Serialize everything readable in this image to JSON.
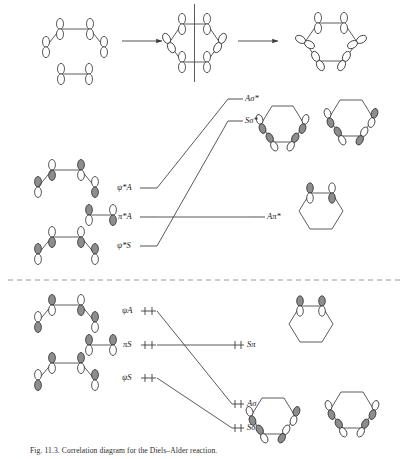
{
  "figure": {
    "caption": "Fig. 11.3. Correlation diagram for the Diels–Alder reaction.",
    "divider": "dashed-separator"
  },
  "colors": {
    "line": "#3c3c3c",
    "bond": "#4a4a4a",
    "lobe_shaded": "#8d8d8d",
    "lobe_open": "#ffffff",
    "lobe_stroke": "#2b2b2b",
    "divider": "#8a8a8a",
    "text": "#1a1a1a"
  },
  "top_row": {
    "label": "reaction-progress-row",
    "reactants": "butadiene + ethylene p-orbital array",
    "arrow1": "→",
    "transition_state": "cyclic transition state with mirror plane",
    "arrow2": "→",
    "product": "cyclohexene sigma framework"
  },
  "correlation": {
    "upper_half": {
      "reactant_levels": [
        {
          "id": "psi-star-A",
          "label": "ψ*A",
          "y": 188,
          "occupancy": ""
        },
        {
          "id": "pi-star-A",
          "label": "π*A",
          "y": 217,
          "occupancy": ""
        },
        {
          "id": "psi-star-S",
          "label": "ψ*S",
          "y": 246,
          "occupancy": ""
        }
      ],
      "product_levels": [
        {
          "id": "A-sigma-star",
          "label": "Aσ*",
          "y": 99,
          "occupancy": ""
        },
        {
          "id": "S-sigma-star",
          "label": "Sσ*",
          "y": 121,
          "occupancy": ""
        },
        {
          "id": "A-pi-star",
          "label": "Aπ*",
          "y": 217,
          "occupancy": ""
        }
      ],
      "links": [
        {
          "from": "psi-star-A",
          "to": "A-sigma-star"
        },
        {
          "from": "psi-star-S",
          "to": "S-sigma-star"
        },
        {
          "from": "pi-star-A",
          "to": "A-pi-star"
        }
      ]
    },
    "lower_half": {
      "reactant_levels": [
        {
          "id": "psi-A",
          "label": "ψA",
          "y": 311,
          "occupancy": "electron-pair"
        },
        {
          "id": "pi-S",
          "label": "πS",
          "y": 345,
          "occupancy": "electron-pair"
        },
        {
          "id": "psi-S",
          "label": "ψS",
          "y": 378,
          "occupancy": "electron-pair"
        }
      ],
      "product_levels": [
        {
          "id": "S-pi",
          "label": "Sπ",
          "y": 345,
          "occupancy": "electron-pair"
        },
        {
          "id": "A-sigma",
          "label": "Aσ",
          "y": 404,
          "occupancy": "electron-pair"
        },
        {
          "id": "S-sigma",
          "label": "Sσ",
          "y": 428,
          "occupancy": "electron-pair"
        }
      ],
      "links": [
        {
          "from": "psi-A",
          "to": "A-sigma"
        },
        {
          "from": "pi-S",
          "to": "S-pi"
        },
        {
          "from": "psi-S",
          "to": "S-sigma"
        }
      ]
    }
  },
  "orbital_pictures": {
    "reactant_left": [
      {
        "id": "butadiene-psi-star-A",
        "kind": "butadiene",
        "y": 170
      },
      {
        "id": "butadiene-psi-star-S",
        "kind": "butadiene",
        "y": 237
      },
      {
        "id": "butadiene-psi-A",
        "kind": "butadiene",
        "y": 305
      },
      {
        "id": "butadiene-psi-S",
        "kind": "butadiene",
        "y": 363
      },
      {
        "id": "ethylene-pi-star",
        "kind": "ethylene",
        "y": 215
      },
      {
        "id": "ethylene-pi",
        "kind": "ethylene",
        "y": 345
      }
    ],
    "product_right": [
      {
        "id": "cyclohexene-S-sigma-star",
        "kind": "hexagon-orbitals",
        "y": 125
      },
      {
        "id": "cyclohexene-A-sigma-star",
        "kind": "hexagon-orbitals",
        "y": 120
      },
      {
        "id": "cyclohexene-A-pi-star",
        "kind": "hexagon-pi",
        "y": 205
      },
      {
        "id": "cyclohexene-S-pi",
        "kind": "hexagon-pi",
        "y": 318
      },
      {
        "id": "cyclohexene-A-sigma",
        "kind": "hexagon-orbitals",
        "y": 405
      },
      {
        "id": "cyclohexene-S-sigma",
        "kind": "hexagon-orbitals",
        "y": 400
      }
    ]
  }
}
